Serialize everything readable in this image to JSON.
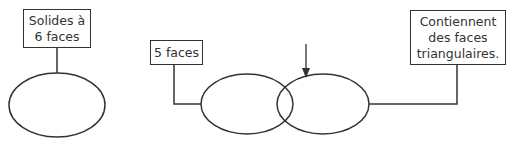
{
  "diagram": {
    "type": "venn-sort",
    "stroke_color": "#333333",
    "text_color": "#333333",
    "background": "#ffffff",
    "left_group": {
      "label": "Solides à\n6 faces",
      "region": "single-circle"
    },
    "venn": {
      "left_circle_label": "5 faces",
      "right_circle_label": "Contiennent\ndes faces\ntriangulaires.",
      "arrow_target": "intersection"
    }
  }
}
